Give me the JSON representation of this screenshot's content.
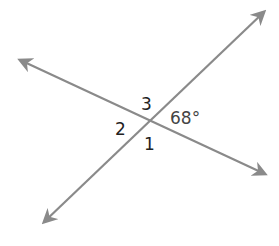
{
  "diagram": {
    "type": "intersecting-lines",
    "line_color": "#8a8a8a",
    "label_color": "#222222",
    "lines": [
      {
        "name": "line-a",
        "direction": "upper-left to lower-right",
        "arrows": "both ends"
      },
      {
        "name": "line-b",
        "direction": "lower-left to upper-right",
        "arrows": "both ends"
      }
    ],
    "angle_labels": [
      {
        "id": "angle-3",
        "text": "3",
        "position": "top"
      },
      {
        "id": "angle-2",
        "text": "2",
        "position": "left"
      },
      {
        "id": "angle-1",
        "text": "1",
        "position": "bottom"
      },
      {
        "id": "angle-given",
        "text": "68°",
        "position": "right",
        "value_degrees": 68
      }
    ]
  }
}
